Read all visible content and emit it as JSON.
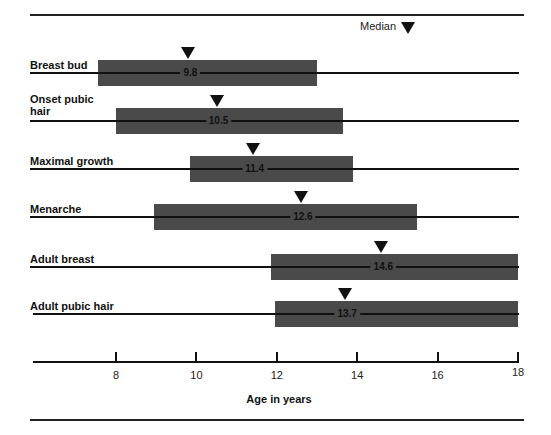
{
  "chart_data": {
    "type": "range-bar",
    "title": "",
    "legend": {
      "label": "Median",
      "marker": "down-triangle"
    },
    "xlabel": "Age in years",
    "ylabel": "",
    "xlim": [
      5.9,
      18
    ],
    "xticks": [
      8,
      10,
      12,
      14,
      16,
      18
    ],
    "grid": false,
    "series": [
      {
        "name": "Breast bud",
        "range": [
          7.55,
          13.0
        ],
        "median": 9.8,
        "median_label": "9.8"
      },
      {
        "name": "Onset pubic hair",
        "range": [
          8.0,
          13.65
        ],
        "median": 10.5,
        "median_label": "10.5"
      },
      {
        "name": "Maximal growth",
        "range": [
          9.85,
          13.9
        ],
        "median": 11.4,
        "median_label": "11.4"
      },
      {
        "name": "Menarche",
        "range": [
          8.95,
          15.5
        ],
        "median": 12.6,
        "median_label": "12.6"
      },
      {
        "name": "Adult breast",
        "range": [
          11.85,
          18.0
        ],
        "median": 14.6,
        "median_label": "14.6"
      },
      {
        "name": "Adult pubic hair",
        "range": [
          11.95,
          18.0
        ],
        "median": 13.7,
        "median_label": "13.7"
      }
    ]
  },
  "labels": {
    "legend": "Median",
    "rows": [
      "Breast bud",
      "Onset pubic hair",
      "Maximal growth",
      "Menarche",
      "Adult breast",
      "Adult pubic hair"
    ],
    "row_label_lines": [
      [
        "Breast bud"
      ],
      [
        "Onset pubic",
        "hair"
      ],
      [
        "Maximal growth"
      ],
      [
        "Menarche"
      ],
      [
        "Adult breast"
      ],
      [
        "Adult pubic hair"
      ]
    ],
    "medians": [
      "9.8",
      "10.5",
      "11.4",
      "12.6",
      "14.6",
      "13.7"
    ],
    "ticks": [
      "8",
      "10",
      "12",
      "14",
      "16",
      "18"
    ],
    "axis_title": "Age in years"
  },
  "colors": {
    "bar": "#4a4a4a",
    "line": "#111111",
    "background": "#ffffff"
  }
}
